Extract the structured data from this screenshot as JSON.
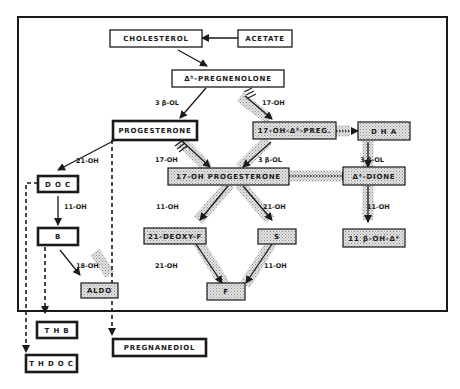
{
  "nodes": {
    "cholesterol": "CHOLESTEROL",
    "acetate": "ACETATE",
    "pregnenolone": "Δ⁵-PREGNENOLONE",
    "progesterone": "PROGESTERONE",
    "oh17_preg": "17-OH-Δ⁵-PREG.",
    "dha": "D H A",
    "oh17_prog": "17-OH  PROGESTERONE",
    "dione": "Δ⁴-DIONE",
    "doc": "D O C",
    "b": "B",
    "deoxy_f": "21-DEOXY-F",
    "s": "S",
    "oh11b_a4": "11 β-OH-Δ⁴",
    "aldo": "ALDO",
    "f": "F",
    "thb": "T H B",
    "thdoc": "T H  D O C",
    "pregnanediol": "PREGNANEDIOL"
  },
  "edge_labels": {
    "preg_to_prog": "3 β-OL",
    "preg_to_17oh": "17-OH",
    "prog_to_doc": "21-OH",
    "prog_to_17ohprog": "17-OH",
    "preg17_to_17ohprog": "3 β-OL",
    "dha_to_dione": "3 β-OL",
    "doc_to_b": "11-OH",
    "ohprog_to_deoxyf": "11-OH",
    "ohprog_to_s": "21-OH",
    "dione_to_11b": "11-OH",
    "b_to_aldo": "18-OH",
    "deoxyf_to_f": "21-OH",
    "s_to_f": "11-OH"
  },
  "colors": {
    "ink": "#1a1a1a",
    "shade": "#c8c8c8",
    "background": "#ffffff"
  }
}
